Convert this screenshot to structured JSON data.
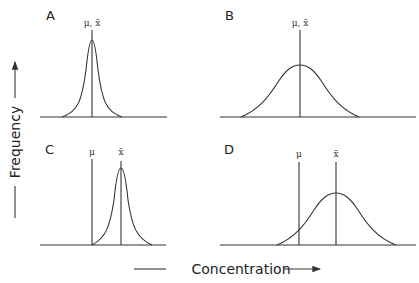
{
  "figure": {
    "x_axis_label": "Concentration",
    "y_axis_label": "Frequency",
    "panels": [
      {
        "id": "A",
        "label": "A",
        "symbols": "μ, x̄",
        "description": "narrow peak, mean equals true value"
      },
      {
        "id": "B",
        "label": "B",
        "symbols": "μ, x̄",
        "description": "broad peak, mean equals true value"
      },
      {
        "id": "C",
        "label": "C",
        "symbols_left": "μ",
        "symbols_right": "x̄",
        "description": "narrow peak, mean offset from true value"
      },
      {
        "id": "D",
        "label": "D",
        "symbols_left": "μ",
        "symbols_right": "x̄",
        "description": "broad peak, mean offset from true value"
      }
    ]
  },
  "colors": {
    "ink": "#333333",
    "background": "#ffffff"
  }
}
